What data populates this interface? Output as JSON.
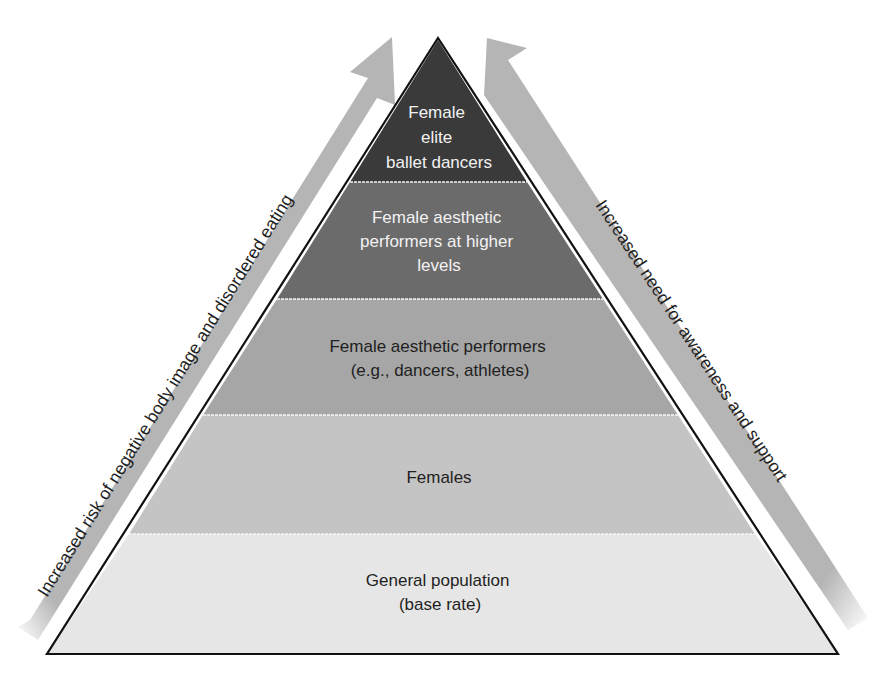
{
  "diagram": {
    "type": "pyramid",
    "tiers": [
      {
        "lines": [
          "Female",
          "elite",
          "ballet dancers"
        ],
        "fill": "#3a3a3a",
        "text_color": "#f2f2f2"
      },
      {
        "lines": [
          "Female aesthetic",
          "performers at higher",
          "levels"
        ],
        "fill": "#6b6b6b",
        "text_color": "#f2f2f2"
      },
      {
        "lines": [
          "Female aesthetic performers",
          "(e.g., dancers, athletes)"
        ],
        "fill": "#a6a6a6",
        "text_color": "#1f1f1f"
      },
      {
        "lines": [
          "Females"
        ],
        "fill": "#c4c4c4",
        "text_color": "#1f1f1f"
      },
      {
        "lines": [
          "General population",
          "(base rate)"
        ],
        "fill": "#e6e6e6",
        "text_color": "#1f1f1f"
      }
    ],
    "left_arrow": {
      "label": "Increased risk of negative body image and disordered eating",
      "color": "#b5b5b5"
    },
    "right_arrow": {
      "label": "Increased need for awareness and support",
      "color": "#b5b5b5"
    },
    "outline_color": "#111111",
    "divider_color": "#f5f5f5"
  }
}
